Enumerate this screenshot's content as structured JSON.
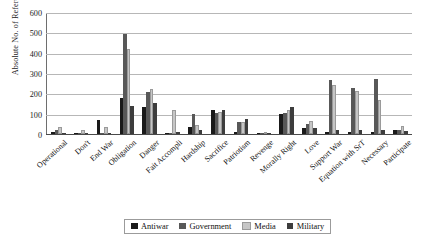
{
  "chart_data": {
    "type": "bar",
    "title": "",
    "xlabel": "",
    "ylabel": "Absolute No. of References",
    "ylim": [
      0,
      600
    ],
    "yticks": [
      0,
      100,
      200,
      300,
      400,
      500,
      600
    ],
    "grid": true,
    "legend_position": "bottom",
    "categories": [
      "Operational",
      "Don't",
      "End War",
      "Obligation",
      "Danger",
      "Fait Accompli",
      "Hardship",
      "Sacrifice",
      "Patriotism",
      "Revenge",
      "Morally Right",
      "Love",
      "Support War",
      "Equation with SrT",
      "Necessary",
      "Participate"
    ],
    "series": [
      {
        "name": "Antiwar",
        "color": "#1a1a1a",
        "values": [
          8,
          4,
          70,
          178,
          133,
          4,
          36,
          120,
          12,
          4,
          96,
          30,
          10,
          10,
          12,
          18
        ]
      },
      {
        "name": "Government",
        "color": "#585858",
        "values": [
          20,
          6,
          6,
          492,
          206,
          6,
          100,
          104,
          58,
          4,
          104,
          50,
          264,
          228,
          270,
          22
        ]
      },
      {
        "name": "Media",
        "color": "#c6c6c6",
        "values": [
          34,
          18,
          34,
          416,
          220,
          120,
          44,
          110,
          60,
          4,
          118,
          66,
          242,
          214,
          166,
          38
        ]
      },
      {
        "name": "Military",
        "color": "#3d3d3d",
        "values": [
          4,
          4,
          4,
          140,
          152,
          12,
          20,
          116,
          74,
          6,
          132,
          30,
          18,
          18,
          22,
          14
        ]
      }
    ]
  },
  "legend": {
    "items": [
      {
        "label": "Antiwar",
        "color": "#1a1a1a"
      },
      {
        "label": "Government",
        "color": "#585858"
      },
      {
        "label": "Media",
        "color": "#c6c6c6"
      },
      {
        "label": "Military",
        "color": "#3d3d3d"
      }
    ]
  }
}
